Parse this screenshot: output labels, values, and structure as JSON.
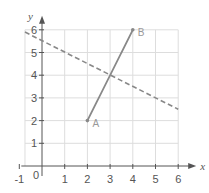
{
  "chart_data": {
    "type": "line",
    "title": "",
    "xlabel": "x",
    "ylabel": "y",
    "xlim": [
      -1,
      6
    ],
    "ylim": [
      0,
      6
    ],
    "grid": true,
    "x_ticks": [
      -1,
      0,
      1,
      2,
      3,
      4,
      5,
      6
    ],
    "x_tick_labels": [
      "-1",
      "0",
      "1",
      "2",
      "3",
      "4",
      "5",
      "6"
    ],
    "y_ticks": [
      1,
      2,
      3,
      4,
      5,
      6
    ],
    "y_tick_labels": [
      "1",
      "2",
      "3",
      "4",
      "5",
      "6"
    ],
    "series": [
      {
        "name": "segment AB",
        "style": "solid",
        "color": "#888888",
        "points": [
          {
            "label": "A",
            "x": 2,
            "y": 2
          },
          {
            "label": "B",
            "x": 4,
            "y": 6
          }
        ]
      },
      {
        "name": "dashed line",
        "style": "dashed",
        "color": "#888888",
        "points": [
          {
            "x": -0.75,
            "y": 5.9
          },
          {
            "x": 6,
            "y": 2.5
          }
        ]
      }
    ],
    "colors": {
      "grid": "#dddddd",
      "axis": "#555555",
      "line": "#888888"
    }
  }
}
